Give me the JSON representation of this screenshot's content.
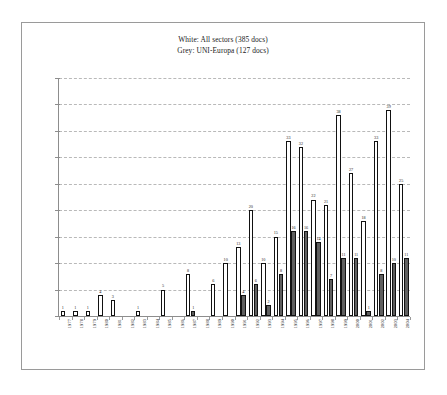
{
  "chart_data": {
    "type": "bar",
    "title": "",
    "legend": {
      "position": "top-center",
      "entries": [
        {
          "label": "White: All sectors (385 docs)",
          "color": "#ffffff",
          "series": "All sectors",
          "total": 385
        },
        {
          "label": "Grey: UNI-Europa (127 docs)",
          "color": "#5f5f5f",
          "series": "UNI-Europa",
          "total": 127
        }
      ]
    },
    "categories": [
      "1977",
      "1978",
      "1979",
      "1980",
      "1981",
      "1982",
      "1983",
      "1984",
      "1985",
      "1986",
      "1987",
      "1988",
      "1989",
      "1990",
      "1991",
      "1992",
      "1993",
      "1994",
      "1995",
      "1996",
      "1997",
      "1998",
      "1999",
      "2000",
      "2001",
      "2002",
      "2003",
      "2004"
    ],
    "series": [
      {
        "name": "All sectors",
        "color": "#ffffff",
        "values": [
          1,
          1,
          1,
          4,
          3,
          0,
          1,
          0,
          5,
          0,
          8,
          0,
          6,
          10,
          13,
          20,
          10,
          15,
          33,
          32,
          22,
          21,
          38,
          27,
          18,
          33,
          39,
          25
        ]
      },
      {
        "name": "UNI-Europa",
        "color": "#5f5f5f",
        "values": [
          0,
          0,
          0,
          0,
          0,
          0,
          0,
          0,
          0,
          0,
          1,
          0,
          0,
          0,
          4,
          6,
          2,
          8,
          16,
          16,
          14,
          7,
          11,
          11,
          1,
          8,
          10,
          11
        ]
      }
    ],
    "xlabel": "",
    "ylabel": "",
    "ylim": [
      0,
      45
    ],
    "ytick_interval": 5,
    "grid": true,
    "show_value_labels": true
  }
}
